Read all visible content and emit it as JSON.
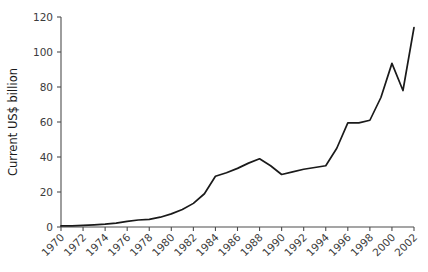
{
  "chart_data": {
    "type": "line",
    "title": "",
    "xlabel": "",
    "ylabel": "Current US$ billion",
    "xlim": [
      1970,
      2002
    ],
    "ylim": [
      0,
      120
    ],
    "grid": false,
    "legend": null,
    "yticks": [
      0,
      20,
      40,
      60,
      80,
      100,
      120
    ],
    "xticks": [
      1970,
      1972,
      1974,
      1976,
      1978,
      1980,
      1982,
      1984,
      1986,
      1988,
      1990,
      1992,
      1994,
      1996,
      1998,
      2000,
      2002
    ],
    "line_color": "#1a1a1a",
    "x": [
      1970,
      1971,
      1972,
      1973,
      1974,
      1975,
      1976,
      1977,
      1978,
      1979,
      1980,
      1981,
      1982,
      1983,
      1984,
      1985,
      1986,
      1987,
      1988,
      1989,
      1990,
      1991,
      1992,
      1993,
      1994,
      1995,
      1996,
      1997,
      1998,
      1999,
      2000,
      2001,
      2002
    ],
    "values": [
      0.6,
      0.7,
      0.9,
      1.2,
      1.6,
      2.2,
      3.2,
      4.0,
      4.4,
      5.6,
      7.5,
      10.0,
      13.5,
      19.0,
      29.0,
      31.0,
      33.5,
      36.5,
      39.0,
      35.0,
      30.0,
      31.5,
      33.0,
      34.0,
      35.0,
      45.0,
      59.5,
      59.5,
      61.0,
      74.0,
      93.5,
      78.0,
      114.0
    ],
    "series_name": "Current US$ billion"
  },
  "axis_labels": {
    "ylabel": "Current US$ billion",
    "yticks": [
      "0",
      "20",
      "40",
      "60",
      "80",
      "100",
      "120"
    ],
    "xticks": [
      "1970",
      "1972",
      "1974",
      "1976",
      "1978",
      "1980",
      "1982",
      "1984",
      "1986",
      "1988",
      "1990",
      "1992",
      "1994",
      "1996",
      "1998",
      "2000",
      "2002"
    ]
  }
}
